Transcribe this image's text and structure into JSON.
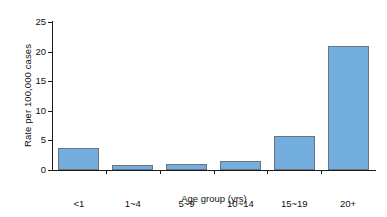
{
  "chart_data": {
    "type": "bar",
    "title": "",
    "subtitle": "",
    "xlabel": "Age group  (yrs)",
    "ylabel": "Rate per 100,000 cases",
    "categories": [
      "<1",
      "1~4",
      "5~9",
      "10~14",
      "15~19",
      "20+"
    ],
    "values": [
      3.8,
      0.9,
      1.0,
      1.6,
      5.7,
      20.9
    ],
    "ylim": [
      0,
      25
    ],
    "yticks": [
      0,
      5,
      10,
      15,
      20,
      25
    ],
    "ytick_labels": [
      "0",
      "5",
      "10",
      "15",
      "20",
      "25"
    ],
    "grid": false,
    "legend": null,
    "legend_position": "none",
    "annotations": [],
    "series": [
      {
        "name": "Rate per 100,000 cases",
        "values": [
          3.8,
          0.9,
          1.0,
          1.6,
          5.7,
          20.9
        ]
      }
    ],
    "colors": {
      "bar_fill": "#74aede",
      "bar_edge": "#6a7480",
      "axis": "#1a1a1a",
      "text": "#111111",
      "background": "#ffffff"
    }
  }
}
